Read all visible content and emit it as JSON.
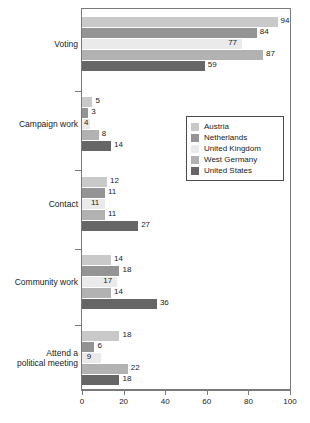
{
  "chart_data": {
    "type": "bar",
    "orientation": "horizontal",
    "title": "",
    "xlabel": "",
    "ylabel": "",
    "xlim": [
      0,
      100
    ],
    "xticks": [
      0,
      20,
      40,
      60,
      80,
      100
    ],
    "grid": false,
    "legend_position": "middle-right",
    "categories": [
      "Voting",
      "Campaign work",
      "Contact",
      "Community work",
      "Attend a political meeting"
    ],
    "category_label_lines": [
      [
        "Voting"
      ],
      [
        "Campaign work"
      ],
      [
        "Contact"
      ],
      [
        "Community work"
      ],
      [
        "Attend a",
        "political meeting"
      ]
    ],
    "series": [
      {
        "name": "Austria",
        "color": "#c9c9c9",
        "values": [
          94,
          5,
          12,
          14,
          18
        ]
      },
      {
        "name": "Netherlands",
        "color": "#949494",
        "values": [
          84,
          3,
          11,
          18,
          6
        ]
      },
      {
        "name": "United Kingdom",
        "color": "#eaeaea",
        "values": [
          77,
          4,
          11,
          17,
          9
        ]
      },
      {
        "name": "West Germany",
        "color": "#b2b2b2",
        "values": [
          87,
          8,
          11,
          14,
          22
        ]
      },
      {
        "name": "United States",
        "color": "#666666",
        "values": [
          59,
          14,
          27,
          36,
          18
        ]
      }
    ]
  },
  "legend": {
    "items": [
      "Austria",
      "Netherlands",
      "United Kingdom",
      "West Germany",
      "United States"
    ]
  },
  "axis": {
    "x_tick_labels": [
      "0",
      "20",
      "40",
      "60",
      "80",
      "100"
    ]
  }
}
